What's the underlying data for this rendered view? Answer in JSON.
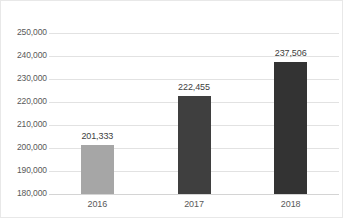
{
  "chart_data": {
    "type": "bar",
    "title": "",
    "subtitle": "",
    "xlabel": "",
    "ylabel": "",
    "categories": [
      "2016",
      "2017",
      "2018"
    ],
    "values": [
      201333,
      222455,
      237506
    ],
    "data_labels": [
      "201,333",
      "222,455",
      "237,506"
    ],
    "bar_colors": [
      "#a6a6a6",
      "#3f3f3f",
      "#333333"
    ],
    "ylim": [
      180000,
      250000
    ],
    "ytick_step": 10000,
    "ytick_labels": [
      "250,000",
      "240,000",
      "230,000",
      "220,000",
      "210,000",
      "200,000",
      "190,000",
      "180,000"
    ],
    "ytick_values": [
      250000,
      240000,
      230000,
      220000,
      210000,
      200000,
      190000,
      180000
    ],
    "grid": true,
    "grid_axis": "y",
    "grid_color": "#e2e2e2",
    "legend": false,
    "legend_position": "none",
    "axis_label_color": "#595959",
    "data_label_color": "#404040",
    "background_color": "#ffffff"
  }
}
